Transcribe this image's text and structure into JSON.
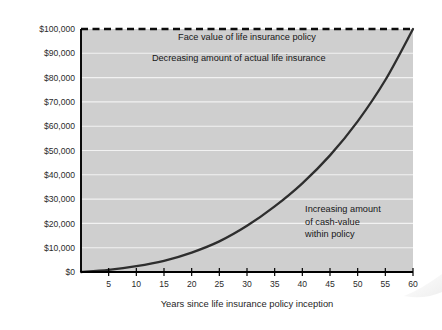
{
  "chart_data": {
    "type": "line",
    "title": "",
    "xlabel": "Years since life insurance policy inception",
    "ylabel": "",
    "xlim": [
      0,
      60
    ],
    "ylim": [
      0,
      100000
    ],
    "grid": true,
    "legend": "none",
    "x_ticks": [
      5,
      10,
      15,
      20,
      25,
      30,
      35,
      40,
      45,
      50,
      55,
      60
    ],
    "x_tick_labels": [
      "5",
      "10",
      "15",
      "20",
      "25",
      "30",
      "35",
      "40",
      "45",
      "50",
      "55",
      "60"
    ],
    "y_ticks": [
      0,
      10000,
      20000,
      30000,
      40000,
      50000,
      60000,
      70000,
      80000,
      90000,
      100000
    ],
    "y_tick_labels": [
      "$0",
      "$10,000",
      "$20,000",
      "$30,000",
      "$40,000",
      "$50,000",
      "$60,000",
      "$70,000",
      "$80,000",
      "$90,000",
      "$100,000"
    ],
    "series": [
      {
        "name": "Face value of life insurance policy",
        "style": "dashed",
        "color": "#0d0d0d",
        "x": [
          0,
          60
        ],
        "values": [
          100000,
          100000
        ]
      },
      {
        "name": "Cash value within policy",
        "style": "solid",
        "color": "#2e2e2e",
        "x": [
          0,
          5,
          10,
          15,
          20,
          25,
          30,
          35,
          40,
          45,
          50,
          55,
          60
        ],
        "values": [
          0,
          900,
          2400,
          4600,
          8000,
          12600,
          19000,
          27000,
          36500,
          48000,
          62000,
          79000,
          100000
        ]
      }
    ],
    "annotations": [
      {
        "name": "face-value-label",
        "lines": [
          "Face value of life insurance policy"
        ],
        "x": 30,
        "y": 95500,
        "align": "middle"
      },
      {
        "name": "decreasing-insurance-label",
        "lines": [
          "Decreasing amount of actual life insurance"
        ],
        "x": 28.5,
        "y": 87000,
        "align": "middle"
      },
      {
        "name": "increasing-cash-value-label",
        "lines": [
          "Increasing amount",
          "of cash-value",
          "within policy"
        ],
        "x": 40.5,
        "y": 24500,
        "align": "start"
      }
    ],
    "colors": {
      "plot_background": "#cfcfcf",
      "gridline": "#f2f2f2",
      "axis": "#000000",
      "page_background": "#ffffff"
    }
  }
}
